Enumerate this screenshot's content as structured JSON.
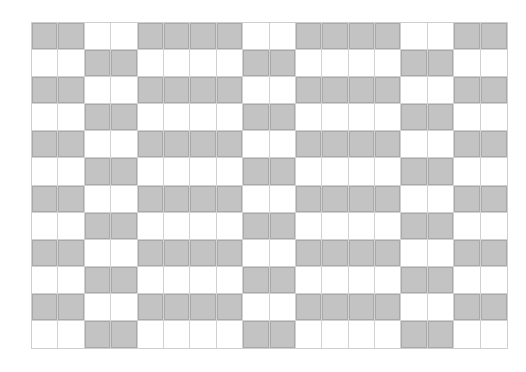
{
  "diagram": {
    "type": "grid-pattern",
    "columns": 18,
    "rows": 12,
    "colors": {
      "filled": "#c3c3c3",
      "filled_border": "#a9a9a9",
      "empty": "#ffffff",
      "grid_line": "#d2d2d2"
    },
    "row_patterns": {
      "A": "110011110011110011",
      "B": "001100001100001100"
    },
    "rows_sequence": [
      "A",
      "B",
      "A",
      "B",
      "A",
      "B",
      "A",
      "B",
      "A",
      "B",
      "A",
      "B"
    ]
  }
}
